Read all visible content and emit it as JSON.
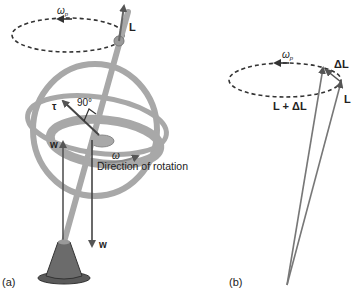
{
  "figure": {
    "panel_a": {
      "label": "(a)",
      "precession_label": "ω",
      "precession_sub": "p",
      "angular_momentum_label": "L",
      "torque_label": "τ",
      "angle_label": "90°",
      "weight_label_left": "w",
      "weight_label_right": "w",
      "spin_label": "ω",
      "rotation_caption": "Direction of rotation"
    },
    "panel_b": {
      "label": "(b)",
      "precession_label": "ω",
      "precession_sub": "p",
      "delta_L_label": "ΔL",
      "L_plus_delta_label": "L + ΔL",
      "L_label": "L"
    },
    "colors": {
      "ring": "#a8a8a8",
      "arrow": "#555555",
      "dashed": "#333333",
      "base": "#6b6b6b",
      "text": "#222222"
    }
  }
}
